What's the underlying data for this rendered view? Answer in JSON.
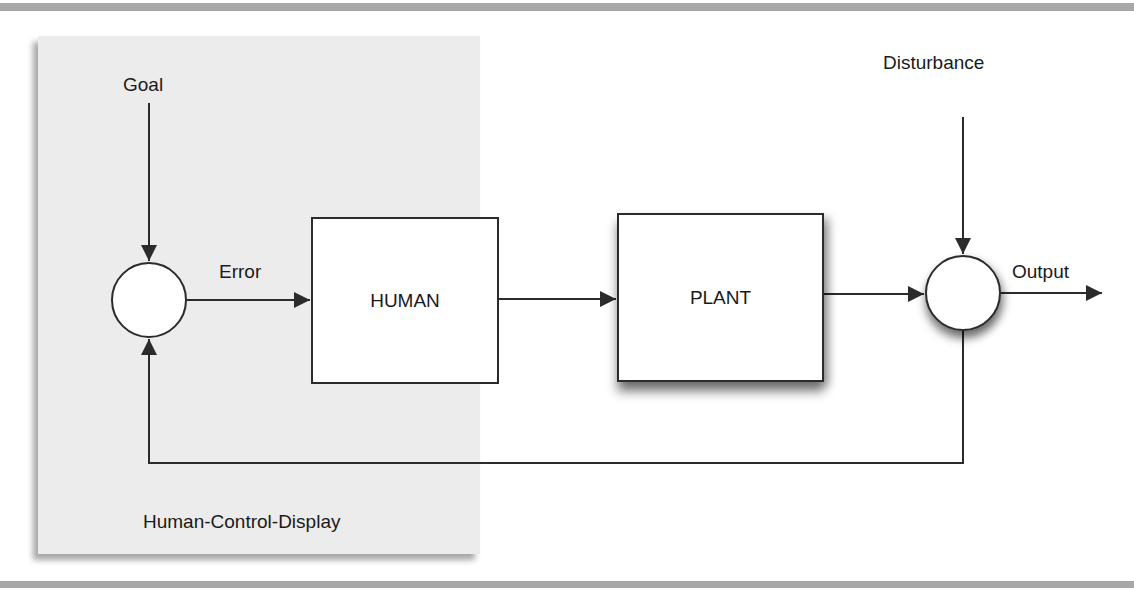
{
  "diagram": {
    "type": "feedback-control-loop",
    "container": {
      "label": "Human-Control-Display",
      "fill": "#ececec"
    },
    "nodes": [
      {
        "id": "goal",
        "kind": "input-label",
        "label": "Goal"
      },
      {
        "id": "comparator",
        "kind": "summing-junction",
        "label": ""
      },
      {
        "id": "human",
        "kind": "block",
        "label": "HUMAN"
      },
      {
        "id": "plant",
        "kind": "block",
        "label": "PLANT"
      },
      {
        "id": "disturbance",
        "kind": "input-label",
        "label": "Disturbance"
      },
      {
        "id": "output-junction",
        "kind": "summing-junction",
        "label": ""
      }
    ],
    "edges": [
      {
        "from": "goal",
        "to": "comparator",
        "label": ""
      },
      {
        "from": "comparator",
        "to": "human",
        "label": "Error"
      },
      {
        "from": "human",
        "to": "plant",
        "label": ""
      },
      {
        "from": "plant",
        "to": "output-junction",
        "label": ""
      },
      {
        "from": "disturbance",
        "to": "output-junction",
        "label": ""
      },
      {
        "from": "output-junction",
        "to": "external",
        "label": "Output"
      },
      {
        "from": "output-junction",
        "to": "comparator",
        "label": "",
        "kind": "feedback"
      }
    ]
  },
  "labels": {
    "goal": "Goal",
    "error": "Error",
    "human": "HUMAN",
    "plant": "PLANT",
    "disturbance": "Disturbance",
    "output": "Output",
    "container": "Human-Control-Display"
  },
  "colors": {
    "line": "#2b2b2b",
    "panel": "#ececec",
    "rule": "#a8a8a8",
    "box_fill": "#ffffff"
  }
}
